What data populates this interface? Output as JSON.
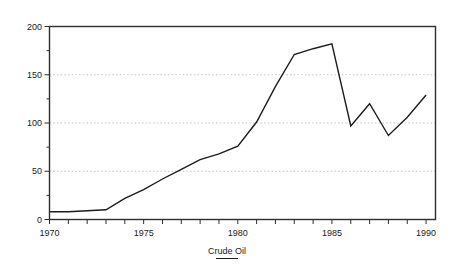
{
  "chart_data": {
    "type": "line",
    "title": "",
    "x": [
      1970,
      1971,
      1972,
      1973,
      1974,
      1975,
      1976,
      1977,
      1978,
      1979,
      1980,
      1981,
      1982,
      1983,
      1984,
      1985,
      1986,
      1987,
      1988,
      1989,
      1990
    ],
    "series": [
      {
        "name": "Crude Oil",
        "values": [
          8,
          8,
          9,
          10,
          22,
          31,
          42,
          52,
          62,
          68,
          76,
          101,
          138,
          171,
          177,
          182,
          97,
          120,
          87,
          106,
          129
        ]
      }
    ],
    "xlim": [
      1970,
      1990.5
    ],
    "ylim": [
      0,
      200
    ],
    "y_major_ticks": [
      0,
      50,
      100,
      150,
      200
    ],
    "y_minor_ticks": [
      25,
      75,
      125,
      175
    ],
    "x_tick_every": 1,
    "x_label_years": [
      1970,
      1975,
      1980,
      1985,
      1990
    ],
    "gridlines": [
      50,
      100,
      150
    ],
    "grid_style": "dotted",
    "legend": {
      "label": "Crude Oil",
      "position": "bottom-center",
      "sample": "solid-line"
    },
    "colors": {
      "line": "#1c1c1c",
      "axis": "#2e2e2e",
      "grid": "#b4b4b4",
      "text": "#1a1a1a",
      "background": "#ffffff"
    }
  }
}
